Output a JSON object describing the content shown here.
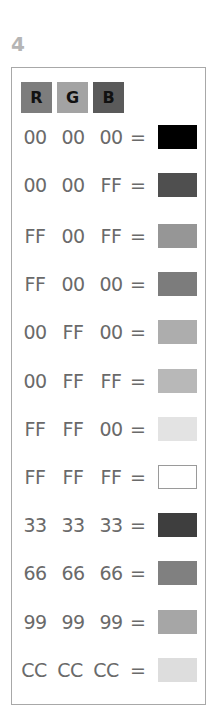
{
  "step_number": "4",
  "header": {
    "channels": [
      {
        "label": "R",
        "color": "#7d7d7d"
      },
      {
        "label": "G",
        "color": "#a3a3a3"
      },
      {
        "label": "B",
        "color": "#5a5a5a"
      }
    ]
  },
  "equals_sign": "=",
  "rows": [
    {
      "r": "00",
      "g": "00",
      "b": "00",
      "swatch": "#000000",
      "border": "#000000"
    },
    {
      "r": "00",
      "g": "00",
      "b": "FF",
      "swatch": "#4f4f4f",
      "border": "#4f4f4f"
    },
    {
      "r": "FF",
      "g": "00",
      "b": "FF",
      "swatch": "#969696",
      "border": "#969696"
    },
    {
      "r": "FF",
      "g": "00",
      "b": "00",
      "swatch": "#7c7c7c",
      "border": "#7c7c7c"
    },
    {
      "r": "00",
      "g": "FF",
      "b": "00",
      "swatch": "#adadad",
      "border": "#adadad"
    },
    {
      "r": "00",
      "g": "FF",
      "b": "FF",
      "swatch": "#b8b8b8",
      "border": "#b8b8b8"
    },
    {
      "r": "FF",
      "g": "FF",
      "b": "00",
      "swatch": "#e3e3e3",
      "border": "#e3e3e3"
    },
    {
      "r": "FF",
      "g": "FF",
      "b": "FF",
      "swatch": "#ffffff",
      "border": "#9a9a9a"
    },
    {
      "r": "33",
      "g": "33",
      "b": "33",
      "swatch": "#3e3e3e",
      "border": "#3e3e3e"
    },
    {
      "r": "66",
      "g": "66",
      "b": "66",
      "swatch": "#808080",
      "border": "#808080"
    },
    {
      "r": "99",
      "g": "99",
      "b": "99",
      "swatch": "#a6a6a6",
      "border": "#a6a6a6"
    },
    {
      "r": "CC",
      "g": "CC",
      "b": "CC",
      "swatch": "#dddddd",
      "border": "#dddddd"
    }
  ]
}
